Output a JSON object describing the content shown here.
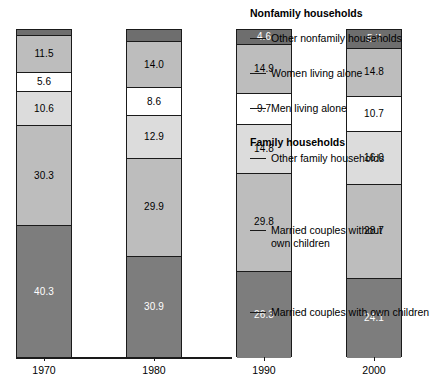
{
  "chart_data": {
    "type": "bar",
    "subtype": "stacked-percent-bar",
    "title": "",
    "xlabel": "",
    "ylabel": "",
    "ylim": [
      0,
      100
    ],
    "grid": false,
    "legend_position": "right-callouts",
    "categories": [
      "1970",
      "1980",
      "1990",
      "2000"
    ],
    "series": [
      {
        "name": "Other nonfamily households",
        "group": "Nonfamily households",
        "color": "#6e6e6e",
        "label_color": "#ffffff",
        "values": [
          1.7,
          3.6,
          4.6,
          5.7
        ]
      },
      {
        "name": "Women living alone",
        "group": "Nonfamily households",
        "color": "#bdbdbd",
        "label_color": "#000000",
        "values": [
          11.5,
          14.0,
          14.9,
          14.8
        ]
      },
      {
        "name": "Men living alone",
        "group": "Nonfamily households",
        "color": "#ffffff",
        "label_color": "#000000",
        "values": [
          5.6,
          8.6,
          9.7,
          10.7
        ]
      },
      {
        "name": "Other family households",
        "group": "Family households",
        "color": "#dcdcdc",
        "label_color": "#000000",
        "values": [
          10.6,
          12.9,
          14.8,
          16.0
        ]
      },
      {
        "name": "Married couples without own children",
        "group": "Family households",
        "color": "#bdbdbd",
        "label_color": "#000000",
        "values": [
          30.3,
          29.9,
          29.8,
          28.7
        ]
      },
      {
        "name": "Married couples with own children",
        "group": "Family households",
        "color": "#7d7d7d",
        "label_color": "#ffffff",
        "values": [
          40.3,
          30.9,
          26.3,
          24.1
        ]
      }
    ]
  },
  "bars": [
    {
      "year": "1970",
      "segments": [
        {
          "value": "1.7",
          "label_outside": true
        },
        {
          "value": "11.5",
          "label_outside": false
        },
        {
          "value": "5.6",
          "label_outside": false
        },
        {
          "value": "10.6",
          "label_outside": false
        },
        {
          "value": "30.3",
          "label_outside": false
        },
        {
          "value": "40.3",
          "label_outside": false
        }
      ]
    },
    {
      "year": "1980",
      "segments": [
        {
          "value": "3.6",
          "label_outside": true
        },
        {
          "value": "14.0",
          "label_outside": false
        },
        {
          "value": "8.6",
          "label_outside": false
        },
        {
          "value": "12.9",
          "label_outside": false
        },
        {
          "value": "29.9",
          "label_outside": false
        },
        {
          "value": "30.9",
          "label_outside": false
        }
      ]
    },
    {
      "year": "1990",
      "segments": [
        {
          "value": "4.6",
          "label_outside": false
        },
        {
          "value": "14.9",
          "label_outside": false
        },
        {
          "value": "9.7",
          "label_outside": false
        },
        {
          "value": "14.8",
          "label_outside": false
        },
        {
          "value": "29.8",
          "label_outside": false
        },
        {
          "value": "26.3",
          "label_outside": false
        }
      ]
    },
    {
      "year": "2000",
      "segments": [
        {
          "value": "5.7",
          "label_outside": false
        },
        {
          "value": "14.8",
          "label_outside": false
        },
        {
          "value": "10.7",
          "label_outside": false
        },
        {
          "value": "16.0",
          "label_outside": false
        },
        {
          "value": "28.7",
          "label_outside": false
        },
        {
          "value": "24.1",
          "label_outside": false
        }
      ]
    }
  ],
  "axis": {
    "years": [
      "1970",
      "1980",
      "1990",
      "2000"
    ]
  },
  "callouts": {
    "nonfamily_heading": "Nonfamily households",
    "family_heading": "Family households",
    "other_nonfamily": "Other nonfamily households",
    "women_alone": "Women living alone",
    "men_alone": "Men living alone",
    "other_family": "Other family households",
    "married_without": "Married couples without\nown children",
    "married_with": "Married couples with own children"
  }
}
